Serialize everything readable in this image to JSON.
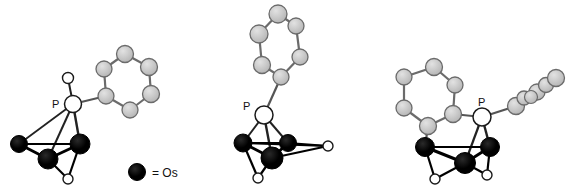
{
  "figure": {
    "kind": "molecular-structure-figure",
    "background_color": "#ffffff",
    "width": 576,
    "height": 189,
    "structure_count": 3
  },
  "legend": {
    "marker_name": "osmium-marker",
    "marker_color": "#000000",
    "text": "= Os"
  },
  "palette": {
    "osmium_fill": "#000000",
    "osmium_stroke": "#000000",
    "phosphorus_fill": "#ffffff",
    "phosphorus_stroke": "#1a1a1a",
    "carbon_fill": "#c6c6c6",
    "carbon_stroke": "#6b6b6b",
    "hydride_fill": "#ffffff",
    "hydride_stroke": "#1a1a1a",
    "metal_bond": "#000000",
    "carbon_bond": "#6b6b6b",
    "mixed_bond": "#3a3a3a"
  },
  "labels": {
    "phosphorus_left": "P",
    "phosphorus_middle": "P",
    "phosphorus_right": "P"
  },
  "structures": [
    {
      "name": "structure-left",
      "description": "Os3 cluster with phosphine ligand bearing one phenyl ring",
      "phosphorus_label": "P",
      "osmium_count": 3,
      "phenyl_ring_count": 1,
      "hydride_count": 2
    },
    {
      "name": "structure-middle",
      "description": "Os3 cluster with phosphine ligand bearing one upright phenyl ring",
      "phosphorus_label": "P",
      "osmium_count": 3,
      "phenyl_ring_count": 1,
      "hydride_count": 2
    },
    {
      "name": "structure-right",
      "description": "Os3 cluster with phosphine ligand bearing two phenyl rings",
      "phosphorus_label": "P",
      "osmium_count": 3,
      "phenyl_ring_count": 2,
      "hydride_count": 2
    }
  ],
  "geometry": {
    "structure_left": {
      "phosphorus": {
        "x": 73,
        "y": 104,
        "r": 8.5
      },
      "hydride_on_p": {
        "x": 68,
        "y": 78,
        "r": 5.5
      },
      "osmium": [
        {
          "name": "os-a",
          "x": 19,
          "y": 144,
          "r": 8.5
        },
        {
          "name": "os-b",
          "x": 48,
          "y": 159,
          "r": 10
        },
        {
          "name": "os-c",
          "x": 80,
          "y": 144,
          "r": 10
        }
      ],
      "hydrides": [
        {
          "name": "hydride-1",
          "x": 68,
          "y": 179,
          "r": 5
        }
      ],
      "phenyl": [
        {
          "name": "c-ipso",
          "x": 106,
          "y": 96,
          "r": 8
        },
        {
          "name": "c-ortho-1",
          "x": 104,
          "y": 69,
          "r": 8
        },
        {
          "name": "c-meta-1",
          "x": 125,
          "y": 54,
          "r": 8.5
        },
        {
          "name": "c-para",
          "x": 149,
          "y": 67,
          "r": 8.5
        },
        {
          "name": "c-meta-2",
          "x": 151,
          "y": 94,
          "r": 8.5
        },
        {
          "name": "c-ortho-2",
          "x": 130,
          "y": 110,
          "r": 8
        }
      ]
    },
    "structure_middle": {
      "phosphorus": {
        "x": 264,
        "y": 115,
        "r": 9
      },
      "osmium": [
        {
          "name": "os-a",
          "x": 243,
          "y": 143,
          "r": 9
        },
        {
          "name": "os-b",
          "x": 288,
          "y": 143,
          "r": 8.5
        },
        {
          "name": "os-c",
          "x": 272,
          "y": 158,
          "r": 11
        }
      ],
      "hydrides": [
        {
          "name": "hydride-1",
          "x": 328,
          "y": 146,
          "r": 5
        },
        {
          "name": "hydride-2",
          "x": 258,
          "y": 178,
          "r": 5
        }
      ],
      "phenyl": [
        {
          "name": "c-ipso",
          "x": 281,
          "y": 77,
          "r": 8
        },
        {
          "name": "c-ortho-1",
          "x": 300,
          "y": 57,
          "r": 8
        },
        {
          "name": "c-meta-1",
          "x": 296,
          "y": 26,
          "r": 8
        },
        {
          "name": "c-para",
          "x": 278,
          "y": 14,
          "r": 9
        },
        {
          "name": "c-meta-2",
          "x": 259,
          "y": 34,
          "r": 9
        },
        {
          "name": "c-ortho-2",
          "x": 262,
          "y": 65,
          "r": 8.5
        }
      ]
    },
    "structure_right": {
      "phosphorus": {
        "x": 482,
        "y": 117,
        "r": 9
      },
      "osmium": [
        {
          "name": "os-a",
          "x": 425,
          "y": 147,
          "r": 9.5
        },
        {
          "name": "os-b",
          "x": 490,
          "y": 147,
          "r": 9.5
        },
        {
          "name": "os-c",
          "x": 465,
          "y": 163,
          "r": 10.5
        }
      ],
      "hydrides": [
        {
          "name": "hydride-1",
          "x": 435,
          "y": 179,
          "r": 5
        },
        {
          "name": "hydride-2",
          "x": 487,
          "y": 175,
          "r": 5
        }
      ],
      "phenyl_upright": [
        {
          "name": "c-ipso",
          "x": 453,
          "y": 114,
          "r": 8.5
        },
        {
          "name": "c-ortho-1",
          "x": 428,
          "y": 126,
          "r": 8.5
        },
        {
          "name": "c-meta-1",
          "x": 404,
          "y": 108,
          "r": 8
        },
        {
          "name": "c-para",
          "x": 404,
          "y": 77,
          "r": 8
        },
        {
          "name": "c-meta-2",
          "x": 434,
          "y": 67,
          "r": 8.5
        },
        {
          "name": "c-ortho-2",
          "x": 455,
          "y": 85,
          "r": 8
        }
      ],
      "phenyl_edge": [
        {
          "name": "c-ipso",
          "x": 516,
          "y": 106,
          "r": 8.5
        },
        {
          "name": "c-a",
          "x": 523,
          "y": 99,
          "r": 7.5
        },
        {
          "name": "c-b",
          "x": 537,
          "y": 91,
          "r": 8
        },
        {
          "name": "c-c",
          "x": 548,
          "y": 84,
          "r": 8.5
        },
        {
          "name": "c-d",
          "x": 556,
          "y": 77,
          "r": 7.5
        },
        {
          "name": "c-e",
          "x": 545,
          "y": 84,
          "r": 7.5
        }
      ]
    },
    "legend": {
      "marker": {
        "x": 137,
        "y": 172,
        "r": 8.5
      },
      "text": {
        "x": 152,
        "y": 177
      }
    }
  }
}
